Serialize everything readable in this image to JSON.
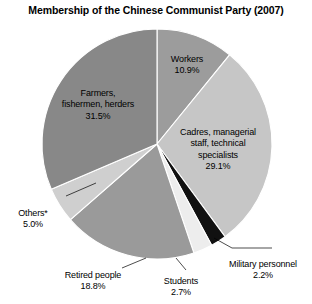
{
  "chart_data": {
    "type": "pie",
    "title": "Membership of the Chinese Communist Party (2007)",
    "xlabel": "",
    "ylabel": "",
    "legend": "none",
    "grid": false,
    "units": "percent",
    "start_angle_deg": 0,
    "direction": "clockwise",
    "categories": [
      "Workers",
      "Cadres, managerial staff, technical specialists",
      "Military personnel",
      "Students",
      "Retired people",
      "Others*",
      "Farmers, fishermen, herders"
    ],
    "values": [
      10.9,
      29.1,
      2.2,
      2.7,
      18.8,
      5.0,
      31.5
    ],
    "slices": [
      {
        "label": "Workers",
        "value": 10.9,
        "value_text": "10.9%",
        "color": "#9c9c9c",
        "label_position": "inside"
      },
      {
        "label": "Cadres, managerial\nstaff, technical\nspecialists",
        "value": 29.1,
        "value_text": "29.1%",
        "color": "#c6c6c6",
        "label_position": "inside"
      },
      {
        "label": "Military personnel",
        "value": 2.2,
        "value_text": "2.2%",
        "color": "#111111",
        "label_position": "outside"
      },
      {
        "label": "Students",
        "value": 2.7,
        "value_text": "2.7%",
        "color": "#ededed",
        "label_position": "outside"
      },
      {
        "label": "Retired people",
        "value": 18.8,
        "value_text": "18.8%",
        "color": "#9a9a9a",
        "label_position": "outside"
      },
      {
        "label": "Others*",
        "value": 5.0,
        "value_text": "5.0%",
        "color": "#cfcfcf",
        "label_position": "outside"
      },
      {
        "label": "Farmers,\nfishermen, herders",
        "value": 31.5,
        "value_text": "31.5%",
        "color": "#888888",
        "label_position": "inside"
      }
    ]
  },
  "labels": {
    "workers": {
      "name": "Workers",
      "pct": "10.9%"
    },
    "cadres": {
      "name": "Cadres, managerial\nstaff, technical\nspecialists",
      "pct": "29.1%"
    },
    "farmers": {
      "name": "Farmers,\nfishermen, herders",
      "pct": "31.5%"
    },
    "others": {
      "name": "Others*",
      "pct": "5.0%"
    },
    "retired": {
      "name": "Retired people",
      "pct": "18.8%"
    },
    "students": {
      "name": "Students",
      "pct": "2.7%"
    },
    "military": {
      "name": "Military personnel",
      "pct": "2.2%"
    }
  }
}
